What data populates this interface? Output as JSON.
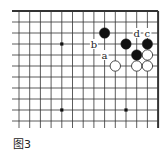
{
  "figure": {
    "caption": "图3",
    "board": {
      "origin_x": 19,
      "origin_y": 11,
      "spacing_x": 10.7,
      "spacing_y": 11,
      "cols": 14,
      "rows": 11,
      "line_color": "#333333",
      "star_points": [
        [
          4,
          3
        ],
        [
          4,
          9
        ],
        [
          10,
          9
        ]
      ]
    },
    "stones": [
      {
        "color": "black",
        "col": 8,
        "row": 2
      },
      {
        "color": "black",
        "col": 10,
        "row": 3
      },
      {
        "color": "black",
        "col": 12,
        "row": 3
      },
      {
        "color": "black",
        "col": 11,
        "row": 4
      },
      {
        "color": "white",
        "col": 12,
        "row": 4
      },
      {
        "color": "white",
        "col": 9,
        "row": 5
      },
      {
        "color": "white",
        "col": 11,
        "row": 5
      },
      {
        "color": "white",
        "col": 12,
        "row": 5
      }
    ],
    "labels": [
      {
        "text": "d",
        "col": 11,
        "row": 2
      },
      {
        "text": "c",
        "col": 12,
        "row": 2
      },
      {
        "text": "b",
        "col": 7,
        "row": 3
      },
      {
        "text": "a",
        "col": 8,
        "row": 4
      }
    ]
  }
}
